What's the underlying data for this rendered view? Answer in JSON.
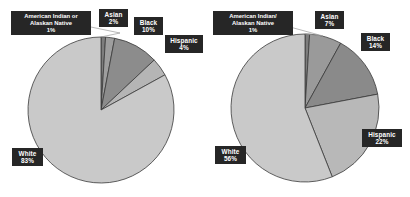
{
  "figure": {
    "background_color": "#ffffff",
    "label_box_color": "#262626",
    "label_text_color": "#ffffff",
    "slice_outline_color": "#3a3a3a",
    "leader_line_color": "#9a9a9a"
  },
  "chart_data": [
    {
      "type": "pie",
      "id": "left-pie",
      "title": "",
      "categories": [
        "American Indian or Alaskan Native",
        "Asian",
        "Black",
        "Hispanic",
        "White"
      ],
      "values": [
        1,
        2,
        10,
        4,
        83
      ],
      "value_labels": [
        "1%",
        "2%",
        "10%",
        "4%",
        "83%"
      ],
      "colors": [
        "#7d7d7d",
        "#9e9e9e",
        "#8c8c8c",
        "#b5b5b5",
        "#c9c9c9"
      ],
      "legend": "labels-with-callouts",
      "grid": false,
      "slices": [
        {
          "name": "American Indian or Alaskan Native",
          "name_line1": "American Indian or",
          "name_line2": "Alaskan Native",
          "percent": "1%",
          "value": 1,
          "color": "#7d7d7d"
        },
        {
          "name": "Asian",
          "percent": "2%",
          "value": 2,
          "color": "#9e9e9e"
        },
        {
          "name": "Black",
          "percent": "10%",
          "value": 10,
          "color": "#8c8c8c"
        },
        {
          "name": "Hispanic",
          "percent": "4%",
          "value": 4,
          "color": "#b5b5b5"
        },
        {
          "name": "White",
          "percent": "83%",
          "value": 83,
          "color": "#c9c9c9"
        }
      ]
    },
    {
      "type": "pie",
      "id": "right-pie",
      "title": "",
      "categories": [
        "American Indian/ Alaskan Native",
        "Asian",
        "Black",
        "Hispanic",
        "White"
      ],
      "values": [
        1,
        7,
        14,
        22,
        56
      ],
      "value_labels": [
        "1%",
        "7%",
        "14%",
        "22%",
        "56%"
      ],
      "colors": [
        "#7d7d7d",
        "#9a9a9a",
        "#8a8a8a",
        "#b8b8b8",
        "#c9c9c9"
      ],
      "legend": "labels-with-callouts",
      "grid": false,
      "slices": [
        {
          "name": "American Indian/ Alaskan Native",
          "name_line1": "American Indian/",
          "name_line2": "Alaskan Native",
          "percent": "1%",
          "value": 1,
          "color": "#7d7d7d"
        },
        {
          "name": "Asian",
          "percent": "7%",
          "value": 7,
          "color": "#9a9a9a"
        },
        {
          "name": "Black",
          "percent": "14%",
          "value": 14,
          "color": "#8a8a8a"
        },
        {
          "name": "Hispanic",
          "percent": "22%",
          "value": 22,
          "color": "#b8b8b8"
        },
        {
          "name": "White",
          "percent": "56%",
          "value": 56,
          "color": "#c9c9c9"
        }
      ]
    }
  ]
}
